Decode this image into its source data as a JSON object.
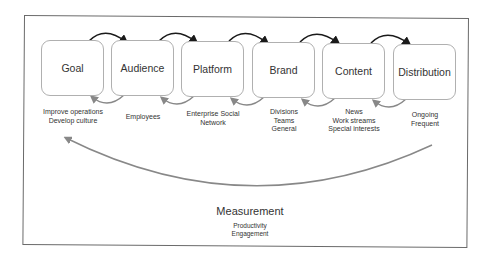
{
  "diagram": {
    "stages": [
      {
        "label": "Goal",
        "details": [
          "Improve operations",
          "Develop culture"
        ]
      },
      {
        "label": "Audience",
        "details": [
          "Employees"
        ]
      },
      {
        "label": "Platform",
        "details": [
          "Enterprise Social",
          "Network"
        ]
      },
      {
        "label": "Brand",
        "details": [
          "Divisions",
          "Teams",
          "General"
        ]
      },
      {
        "label": "Content",
        "details": [
          "News",
          "Work streams",
          "Special interests"
        ]
      },
      {
        "label": "Distribution",
        "details": [
          "Ongoing",
          "Frequent"
        ]
      }
    ],
    "measurement": {
      "label": "Measurement",
      "details": [
        "Productivity",
        "Engagement"
      ]
    },
    "colors": {
      "forward_arrow": "#1a1a1a",
      "back_arrow": "#888888",
      "box_border": "#b0b0b0",
      "frame": "#6a6a6a"
    }
  }
}
